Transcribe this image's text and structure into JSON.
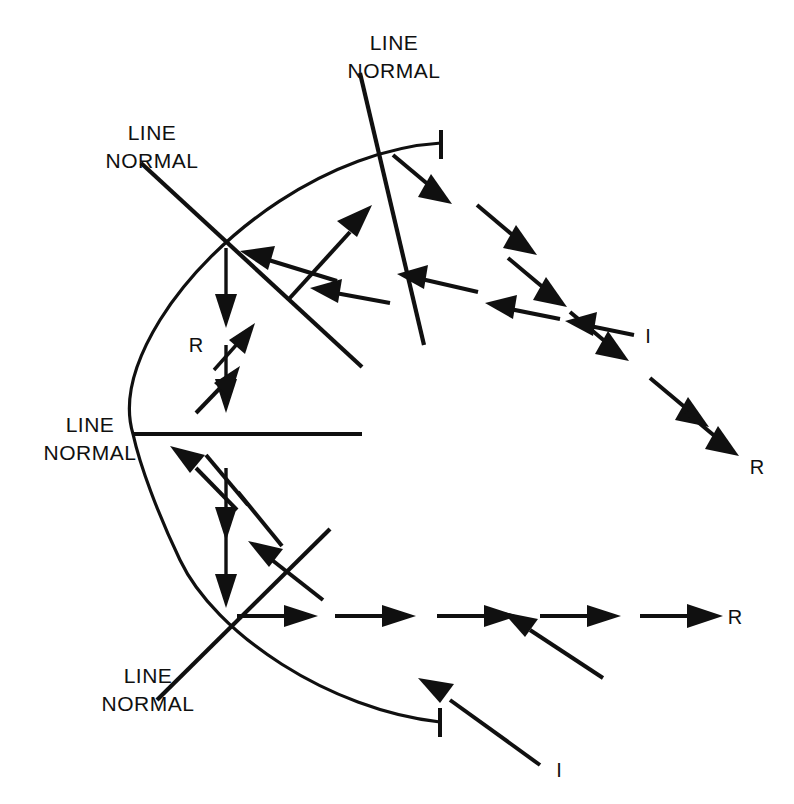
{
  "diagram": {
    "background_color": "#ffffff",
    "ink_color": "#101010",
    "width": 794,
    "height": 804,
    "labels": {
      "line_normal_top": {
        "line1": "LINE",
        "line2": "NORMAL"
      },
      "line_normal_upper_left": {
        "line1": "LINE",
        "line2": "NORMAL"
      },
      "line_normal_middle_left": {
        "line1": "LINE",
        "line2": "NORMAL"
      },
      "line_normal_lower_left": {
        "line1": "LINE",
        "line2": "NORMAL"
      },
      "incident_upper": "I",
      "incident_lower": "I",
      "reflected_upper_right": "R",
      "reflected_inner": "R",
      "reflected_lower_right": "R"
    }
  },
  "mirror": {
    "name": "curved-mirror-arc",
    "shape": "arc",
    "vertex_x": 133,
    "vertex_y": 434,
    "top_end": {
      "x": 441,
      "y": 143
    },
    "bottom_end": {
      "x": 440,
      "y": 722
    }
  },
  "vertices": [
    {
      "name": "top-reflection-point",
      "x": 386,
      "y": 148
    },
    {
      "name": "upper-left-reflection-point",
      "x": 226,
      "y": 243
    },
    {
      "name": "mirror-vertex-point",
      "x": 160,
      "y": 434
    },
    {
      "name": "bottom-reflection-point",
      "x": 226,
      "y": 615
    }
  ],
  "normals": [
    {
      "name": "normal-top",
      "x1": 360,
      "y1": 73,
      "x2": 424,
      "y2": 345
    },
    {
      "name": "normal-upper-left",
      "x1": 141,
      "y1": 163,
      "x2": 362,
      "y2": 367
    },
    {
      "name": "normal-middle-left",
      "x1": 133,
      "y1": 434,
      "x2": 362,
      "y2": 434
    },
    {
      "name": "normal-lower-left",
      "x1": 157,
      "y1": 700,
      "x2": 330,
      "y2": 529
    }
  ],
  "rays": {
    "upper_incident": {
      "label": "I",
      "description": "dashed incident ray arriving from lower right toward top reflection point"
    },
    "upper_reflected": {
      "label": "R",
      "description": "dashed reflected ray leaving top reflection point toward lower right"
    },
    "inner_reflected": {
      "label": "R",
      "description": "short vertical downward arrows inside the mirror cavity"
    },
    "lower_incident": {
      "label": "I",
      "description": "incident ray arriving from lower right to bottom reflection point"
    },
    "lower_reflected": {
      "label": "R",
      "description": "horizontal reflected ray travelling right from bottom reflection point"
    }
  }
}
